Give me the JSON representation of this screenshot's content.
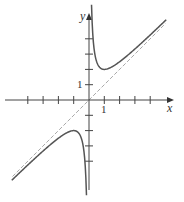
{
  "chart_data": {
    "type": "line",
    "title": "",
    "xlabel": "x",
    "ylabel": "y",
    "xlim": [
      -5.5,
      5.3
    ],
    "ylim": [
      -5.8,
      5.5
    ],
    "grid": false,
    "tick_labels": {
      "x": [
        "1"
      ],
      "y": [
        "1"
      ]
    },
    "x_ticks": [
      -4,
      -3,
      -2,
      -1,
      1,
      2,
      3,
      4
    ],
    "y_ticks": [
      -4,
      -3,
      -2,
      -1,
      1,
      2,
      3,
      4
    ],
    "series": [
      {
        "name": "y = x + 1/x",
        "style": "solid",
        "color": "#555555",
        "x": [
          -5,
          -4,
          -3,
          -2,
          -1.5,
          -1,
          -0.7,
          -0.5,
          -0.35,
          -0.25,
          -0.18,
          0.18,
          0.25,
          0.35,
          0.5,
          0.7,
          1,
          1.5,
          2,
          3,
          4,
          5
        ],
        "values": [
          -5.2,
          -4.25,
          -3.33,
          -2.5,
          -2.17,
          -2,
          -2.13,
          -2.5,
          -3.21,
          -4.25,
          -5.74,
          5.74,
          4.25,
          3.21,
          2.5,
          2.13,
          2,
          2.17,
          2.5,
          3.33,
          4.25,
          5.2
        ]
      },
      {
        "name": "asymptote y = x",
        "style": "dashed",
        "color": "#aaaaaa",
        "x": [
          -5,
          5
        ],
        "values": [
          -5,
          5
        ]
      }
    ]
  },
  "labels": {
    "x_axis": "x",
    "y_axis": "y",
    "x_tick_one": "1",
    "y_tick_one": "1"
  }
}
